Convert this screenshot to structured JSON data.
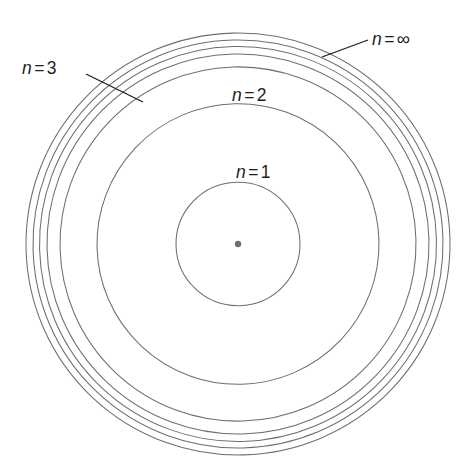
{
  "figure": {
    "kind": "bohr-model-shell-diagram",
    "width": 468,
    "height": 471,
    "background_color": "#ffffff",
    "orbit_stroke_color": "#6e6e6e",
    "nucleus_color": "#6f6f6f",
    "label_color": "#1d1d1d",
    "leader_color": "#1b1b1b",
    "tilt_degrees": -1.4,
    "center": {
      "x": 238,
      "y": 244
    },
    "nucleus": {
      "radius": 3.2,
      "name": "nucleus"
    }
  },
  "orbits": [
    {
      "level": "1",
      "radius": 62,
      "labeled": true
    },
    {
      "level": "2",
      "radius": 141,
      "labeled": true
    },
    {
      "level": "3",
      "radius": 178,
      "labeled": true
    },
    {
      "level": "4",
      "radius": 191,
      "labeled": false
    },
    {
      "level": "5",
      "radius": 198.5,
      "labeled": false
    },
    {
      "level": "6",
      "radius": 205,
      "labeled": false
    },
    {
      "level": "inf",
      "radius": 212,
      "labeled": true
    }
  ],
  "labels": [
    {
      "name": "label-n-1",
      "variable": "n",
      "equals": "=",
      "value": "1",
      "text": "n = 1",
      "x": 236,
      "y": 164,
      "has_leader": false
    },
    {
      "name": "label-n-2",
      "variable": "n",
      "equals": "=",
      "value": "2",
      "text": "n = 2",
      "x": 232,
      "y": 87,
      "has_leader": false
    },
    {
      "name": "label-n-3",
      "variable": "n",
      "equals": "=",
      "value": "3",
      "text": "n = 3",
      "x": 22,
      "y": 60,
      "has_leader": true,
      "leader": {
        "x1": 86,
        "y1": 74,
        "x2": 143,
        "y2": 102
      }
    },
    {
      "name": "label-n-infinity",
      "variable": "n",
      "equals": "=",
      "value": "∞",
      "text": "n = ∞",
      "x": 372,
      "y": 30,
      "has_leader": true,
      "leader": {
        "x1": 368,
        "y1": 40,
        "x2": 322,
        "y2": 57
      }
    }
  ]
}
